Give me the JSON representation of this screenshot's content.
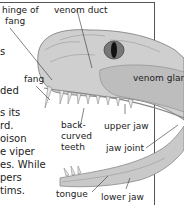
{
  "diagram": {
    "labels": {
      "hinge_of_fang_1": "hinge of",
      "hinge_of_fang_2": "fang",
      "venom_duct": "venom duct",
      "fang": "fang",
      "venom_gland": "venom gland",
      "back_curved_1": "back-",
      "back_curved_2": "curved",
      "back_curved_3": "teeth",
      "upper_jaw": "upper jaw",
      "jaw_joint": "jaw joint",
      "tongue": "tongue",
      "lower_jaw": "lower jaw"
    }
  },
  "body_text": {
    "lines": [
      "s",
      "",
      "ded",
      "",
      "s its",
      "rd.",
      "oison",
      "e viper",
      "es. While",
      "pers",
      "tims."
    ]
  },
  "colors": {
    "frame": "#555555",
    "text": "#222222",
    "snake_light": "#cfcfcf",
    "snake_dark": "#8a8a8a"
  }
}
